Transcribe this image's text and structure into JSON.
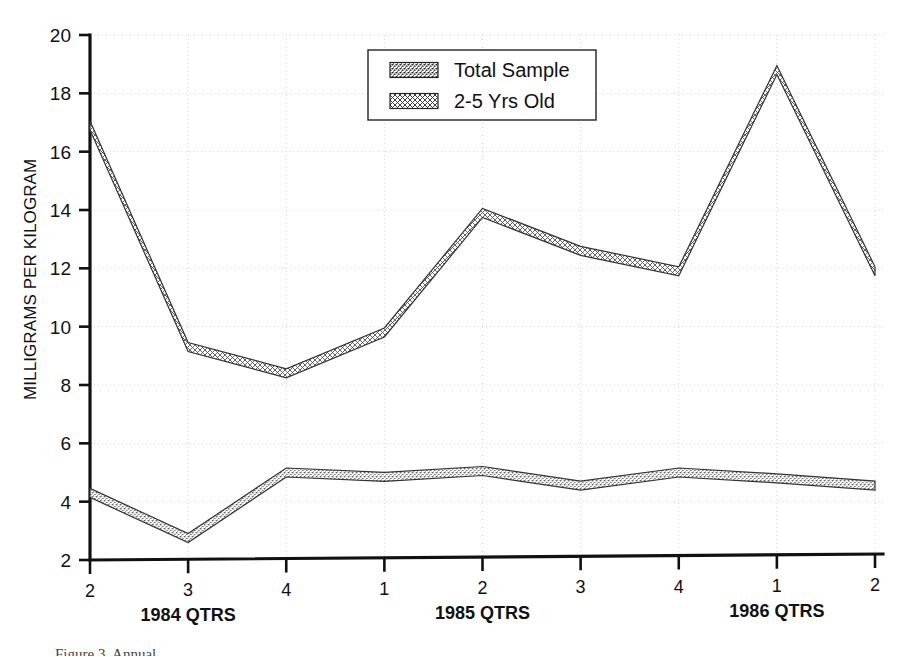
{
  "chart_data": {
    "type": "line",
    "title": "",
    "xlabel": "",
    "ylabel": "MILLIGRAMS PER KILOGRAM",
    "ylim": [
      2,
      20
    ],
    "y_ticks": [
      2,
      4,
      6,
      8,
      10,
      12,
      14,
      16,
      18,
      20
    ],
    "grid": true,
    "legend_position": "top-center-right",
    "x_tick_labels": [
      "2",
      "3",
      "4",
      "1",
      "2",
      "3",
      "4",
      "1",
      "2"
    ],
    "x_group_labels": [
      {
        "text": "1984 QTRS",
        "under_tick_index": 1
      },
      {
        "text": "1985 QTRS",
        "under_tick_index": 4
      },
      {
        "text": "1986 QTRS",
        "under_tick_index": 7
      }
    ],
    "categories": [
      "1984 Q2",
      "1984 Q3",
      "1984 Q4",
      "1985 Q1",
      "1985 Q2",
      "1985 Q3",
      "1985 Q4",
      "1986 Q1",
      "1986 Q2"
    ],
    "series": [
      {
        "name": "Total Sample",
        "pattern": "dense-stipple",
        "values": [
          4.3,
          2.75,
          5.0,
          4.85,
          5.05,
          4.55,
          5.0,
          4.8,
          4.55
        ]
      },
      {
        "name": "2-5 Yrs Old",
        "pattern": "light-crosshatch",
        "values": [
          16.9,
          9.3,
          8.4,
          9.8,
          13.9,
          12.6,
          11.9,
          18.8,
          11.9
        ]
      }
    ]
  },
  "legend": {
    "entries": [
      {
        "label": "Total Sample"
      },
      {
        "label": "2-5 Yrs Old"
      }
    ]
  },
  "axis": {
    "y_title": "MILLIGRAMS PER KILOGRAM",
    "y_ticks": [
      "20",
      "18",
      "16",
      "14",
      "12",
      "10",
      "8",
      "6",
      "4",
      "2"
    ],
    "x_ticks": [
      "2",
      "3",
      "4",
      "1",
      "2",
      "3",
      "4",
      "1",
      "2"
    ],
    "x_groups": [
      "1984 QTRS",
      "1985 QTRS",
      "1986 QTRS"
    ]
  },
  "caption": {
    "text": "Figure 3. Annual"
  },
  "colors": {
    "ink": "#111111",
    "grid": "#c9c9c9",
    "background": "#ffffff",
    "series_outline": "#333333"
  }
}
